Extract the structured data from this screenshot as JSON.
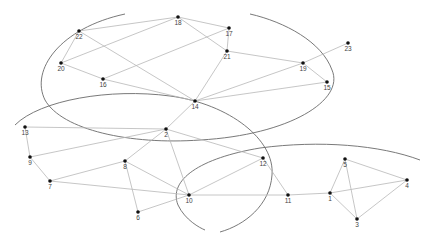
{
  "diagram": {
    "type": "graph-with-community-regions",
    "nodes": [
      {
        "id": "1",
        "x": 330,
        "y": 193
      },
      {
        "id": "2",
        "x": 166,
        "y": 129
      },
      {
        "id": "3",
        "x": 357,
        "y": 219
      },
      {
        "id": "4",
        "x": 407,
        "y": 180
      },
      {
        "id": "5",
        "x": 345,
        "y": 159
      },
      {
        "id": "6",
        "x": 138,
        "y": 212
      },
      {
        "id": "7",
        "x": 50,
        "y": 181
      },
      {
        "id": "8",
        "x": 125,
        "y": 161
      },
      {
        "id": "9",
        "x": 30,
        "y": 157
      },
      {
        "id": "10",
        "x": 189,
        "y": 195
      },
      {
        "id": "11",
        "x": 288,
        "y": 195
      },
      {
        "id": "12",
        "x": 263,
        "y": 158
      },
      {
        "id": "13",
        "x": 25,
        "y": 127
      },
      {
        "id": "14",
        "x": 195,
        "y": 101
      },
      {
        "id": "15",
        "x": 327,
        "y": 82
      },
      {
        "id": "16",
        "x": 103,
        "y": 79
      },
      {
        "id": "17",
        "x": 229,
        "y": 28
      },
      {
        "id": "18",
        "x": 178,
        "y": 17
      },
      {
        "id": "19",
        "x": 303,
        "y": 63
      },
      {
        "id": "20",
        "x": 61,
        "y": 63
      },
      {
        "id": "21",
        "x": 227,
        "y": 51
      },
      {
        "id": "22",
        "x": 79,
        "y": 31
      },
      {
        "id": "23",
        "x": 348,
        "y": 43
      }
    ],
    "edges": [
      [
        "22",
        "18"
      ],
      [
        "22",
        "20"
      ],
      [
        "22",
        "14"
      ],
      [
        "20",
        "18"
      ],
      [
        "20",
        "16"
      ],
      [
        "16",
        "17"
      ],
      [
        "16",
        "14"
      ],
      [
        "18",
        "17"
      ],
      [
        "18",
        "21"
      ],
      [
        "17",
        "21"
      ],
      [
        "21",
        "14"
      ],
      [
        "21",
        "19"
      ],
      [
        "14",
        "19"
      ],
      [
        "14",
        "15"
      ],
      [
        "14",
        "2"
      ],
      [
        "19",
        "23"
      ],
      [
        "19",
        "15"
      ],
      [
        "13",
        "2"
      ],
      [
        "13",
        "9"
      ],
      [
        "9",
        "2"
      ],
      [
        "9",
        "7"
      ],
      [
        "7",
        "8"
      ],
      [
        "7",
        "10"
      ],
      [
        "8",
        "2"
      ],
      [
        "8",
        "10"
      ],
      [
        "8",
        "6"
      ],
      [
        "6",
        "10"
      ],
      [
        "2",
        "10"
      ],
      [
        "2",
        "12"
      ],
      [
        "10",
        "12"
      ],
      [
        "10",
        "11"
      ],
      [
        "12",
        "11"
      ],
      [
        "11",
        "1"
      ],
      [
        "1",
        "5"
      ],
      [
        "1",
        "4"
      ],
      [
        "1",
        "3"
      ],
      [
        "5",
        "4"
      ],
      [
        "5",
        "3"
      ],
      [
        "4",
        "3"
      ]
    ],
    "regions": [
      {
        "name": "upper-community",
        "path": "M 125 14 C 60 28, 30 70, 45 100 C 62 130, 130 145, 200 140 C 290 135, 345 100, 332 70 C 322 42, 285 22, 250 14"
      },
      {
        "name": "middle-community",
        "path": "M 15 125 C 40 100, 110 88, 170 96 C 230 104, 275 140, 272 175 C 270 205, 245 225, 220 232"
      },
      {
        "name": "lower-community",
        "path": "M 420 160 C 380 145, 320 140, 260 148 C 200 158, 168 180, 178 205 C 185 220, 200 228, 205 230"
      }
    ]
  }
}
